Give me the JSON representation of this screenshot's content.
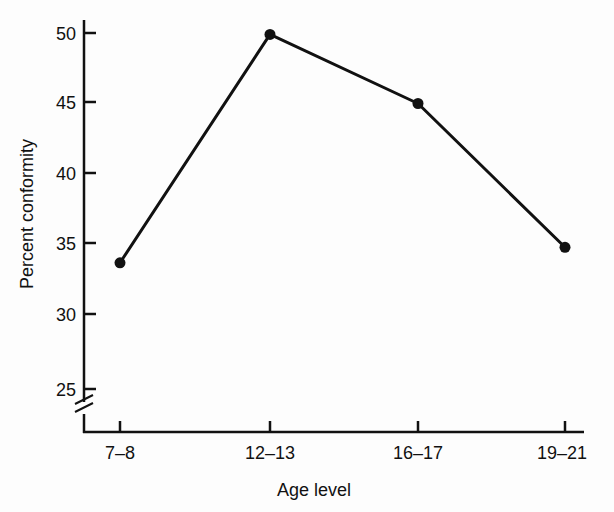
{
  "chart_data": {
    "type": "line",
    "title": "",
    "xlabel": "Age level",
    "ylabel": "Percent conformity",
    "categories": [
      "7–8",
      "12–13",
      "16–17",
      "19–21"
    ],
    "series": [
      {
        "name": "Percent conformity",
        "values": [
          33.7,
          49.9,
          45.0,
          34.8
        ],
        "marker": "filled-circle",
        "color": "#111111"
      }
    ],
    "yticks": [
      25,
      30,
      35,
      40,
      45,
      50
    ],
    "ylim": [
      22,
      51
    ],
    "y_axis_break": true,
    "grid": false,
    "legend": "none"
  },
  "labels": {
    "xlabel": "Age level",
    "ylabel": "Percent conformity",
    "xticks": [
      "7–8",
      "12–13",
      "16–17",
      "19–21"
    ],
    "yticks": [
      "50",
      "45",
      "40",
      "35",
      "30",
      "25"
    ]
  }
}
